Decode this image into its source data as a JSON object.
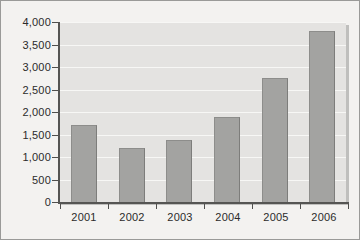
{
  "chart_data": {
    "type": "bar",
    "title": "",
    "subtitle": "",
    "xlabel": "",
    "ylabel": "",
    "categories": [
      "2001",
      "2002",
      "2003",
      "2004",
      "2005",
      "2006"
    ],
    "values": [
      1700,
      1200,
      1380,
      1880,
      2760,
      3800
    ],
    "series": [
      {
        "name": "",
        "values": [
          1700,
          1200,
          1380,
          1880,
          2760,
          3800
        ]
      }
    ],
    "ylim": [
      0,
      4000
    ],
    "ytick_labels": [
      "4,000",
      "3,500",
      "3,000",
      "2,500",
      "2,000",
      "1,500",
      "1,000",
      "500",
      "0"
    ],
    "ytick_values": [
      4000,
      3500,
      3000,
      2500,
      2000,
      1500,
      1000,
      500,
      0
    ],
    "ytick_step": 500,
    "grid": true,
    "grid_axis": "y",
    "legend": false,
    "legend_position": "none",
    "annotations": [],
    "colors": {
      "bar_fill": "#a3a3a1",
      "bar_edge": "#8d8d8b",
      "plot_background": "#e4e3e1",
      "figure_background": "#f3f2f0",
      "gridline": "#f7f7f5",
      "axis": "#555553",
      "text": "#2b2b2b",
      "frame_border": "#9a9a98",
      "plot_shadow": "#bfbfbd"
    }
  }
}
